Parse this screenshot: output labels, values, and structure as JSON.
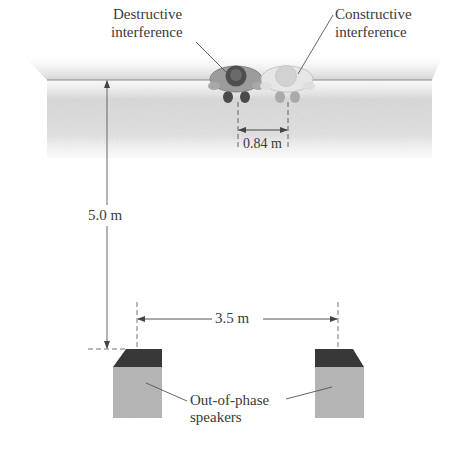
{
  "figure": {
    "type": "physics-diagram"
  },
  "labels": {
    "destructive_line1": "Destructive",
    "destructive_line2": "interference",
    "constructive_line1": "Constructive",
    "constructive_line2": "interference",
    "person_spacing": "0.84 m",
    "distance_to_wall": "5.0 m",
    "speaker_spacing": "3.5 m",
    "speakers_line1": "Out-of-phase",
    "speakers_line2": "speakers"
  },
  "measurements": {
    "listener_separation_m": 0.84,
    "speaker_to_listener_distance_m": 5.0,
    "speaker_separation_m": 3.5
  },
  "elements": {
    "listeners": [
      {
        "name": "destructive-listener",
        "shade": "dark"
      },
      {
        "name": "constructive-listener",
        "shade": "light"
      }
    ],
    "speakers": [
      {
        "name": "left-speaker"
      },
      {
        "name": "right-speaker"
      }
    ]
  },
  "colors": {
    "floor_band": "#d6d6d6",
    "wall_line": "#8a8a8a",
    "dimension_line": "#555555",
    "speaker_top": "#3a3a3a",
    "speaker_front": "#b8b8b8",
    "dark_listener_body": "#9c9c9c",
    "dark_listener_head": "#4e4e4e",
    "light_listener_body": "#e4e4e4",
    "light_listener_head": "#cfcfcf"
  }
}
